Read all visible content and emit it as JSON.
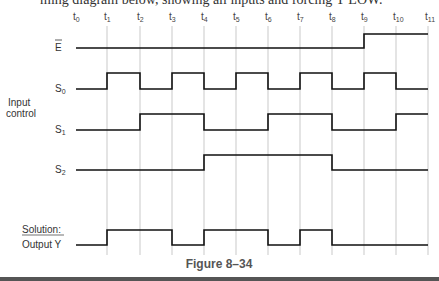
{
  "top_partial_text": "ming diagram below, showing all inputs and forcing Y LOW.",
  "time_labels": [
    "t0",
    "t1",
    "t2",
    "t3",
    "t4",
    "t5",
    "t6",
    "t7",
    "t8",
    "t9",
    "t10",
    "t11"
  ],
  "group_label_line1": "Input",
  "group_label_line2": "control",
  "signals": [
    {
      "name": "E",
      "label": "E",
      "overbar": true,
      "levels": [
        0,
        0,
        0,
        0,
        0,
        0,
        0,
        0,
        0,
        1,
        1
      ]
    },
    {
      "name": "S0",
      "label": "S",
      "sub": "0",
      "levels": [
        0,
        1,
        0,
        1,
        0,
        1,
        0,
        1,
        0,
        1,
        0
      ]
    },
    {
      "name": "S1",
      "label": "S",
      "sub": "1",
      "levels": [
        0,
        0,
        1,
        1,
        0,
        0,
        1,
        1,
        0,
        0,
        1
      ]
    },
    {
      "name": "S2",
      "label": "S",
      "sub": "2",
      "levels": [
        0,
        0,
        0,
        0,
        1,
        1,
        1,
        1,
        0,
        0,
        0
      ]
    }
  ],
  "solution_label": "Solution:",
  "output_label": "Output Y",
  "output": {
    "name": "Y",
    "levels": [
      0,
      1,
      1,
      0,
      1,
      1,
      0,
      1,
      0,
      0,
      0
    ]
  },
  "caption": "Figure 8–34"
}
